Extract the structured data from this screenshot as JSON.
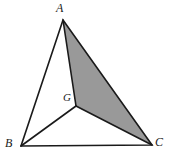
{
  "figure": {
    "kind": "geometry-diagram",
    "width": 169,
    "height": 164,
    "background_color": "#ffffff",
    "stroke_color": "#1a1a1a",
    "shaded_fill_color": "#999999",
    "label_color": "#1a1a1a"
  },
  "labels": {
    "a": "A",
    "b": "B",
    "c": "C",
    "g": "G"
  },
  "chart_data": {
    "type": "scatter",
    "title": "",
    "xlabel": "",
    "ylabel": "",
    "grid": false,
    "legend": "none",
    "xlim": [
      0,
      169
    ],
    "ylim": [
      0,
      164
    ],
    "points": [
      {
        "name": "A",
        "label": "A",
        "x": 63,
        "y": 20
      },
      {
        "name": "B",
        "label": "B",
        "x": 21,
        "y": 146
      },
      {
        "name": "C",
        "label": "C",
        "x": 152,
        "y": 145
      },
      {
        "name": "G",
        "label": "G",
        "x": 76,
        "y": 106
      }
    ],
    "segments": [
      {
        "name": "AB",
        "from": "A",
        "to": "B"
      },
      {
        "name": "BC",
        "from": "B",
        "to": "C"
      },
      {
        "name": "CA",
        "from": "C",
        "to": "A"
      },
      {
        "name": "GA",
        "from": "G",
        "to": "A"
      },
      {
        "name": "GB",
        "from": "G",
        "to": "B"
      },
      {
        "name": "GC",
        "from": "G",
        "to": "C"
      }
    ],
    "shaded_regions": [
      {
        "name": "AGC",
        "vertices": [
          "A",
          "G",
          "C"
        ],
        "fill": "#999999"
      }
    ],
    "annotations": []
  },
  "geometry": {
    "outer_triangle_points": "63,20 21,146 152,145",
    "shaded_triangle_points": "63,20 76,106 152,145",
    "segment_ga": {
      "x1": 76,
      "y1": 106,
      "x2": 63,
      "y2": 20
    },
    "segment_gb": {
      "x1": 76,
      "y1": 106,
      "x2": 21,
      "y2": 146
    },
    "segment_gc": {
      "x1": 76,
      "y1": 106,
      "x2": 152,
      "y2": 145
    },
    "segment_ab": {
      "x1": 63,
      "y1": 20,
      "x2": 21,
      "y2": 146
    },
    "segment_bc": {
      "x1": 21,
      "y1": 146,
      "x2": 152,
      "y2": 145
    },
    "segment_ca": {
      "x1": 152,
      "y1": 145,
      "x2": 63,
      "y2": 20
    }
  }
}
